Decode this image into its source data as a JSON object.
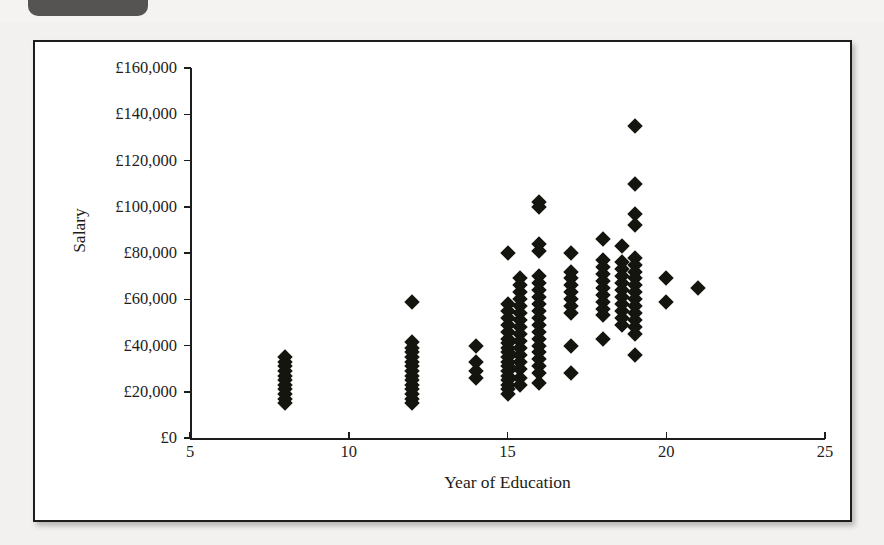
{
  "caption": {
    "badge_label": "",
    "text": ""
  },
  "chart_data": {
    "type": "scatter",
    "title": "",
    "xlabel": "Year of Education",
    "ylabel": "Salary",
    "xlim": [
      5,
      25
    ],
    "ylim": [
      0,
      160000
    ],
    "grid": false,
    "legend": null,
    "marker": "filled-diamond",
    "marker_color": "#15150f",
    "x_ticks": [
      5,
      10,
      15,
      20,
      25
    ],
    "x_tick_labels": [
      "5",
      "10",
      "15",
      "20",
      "25"
    ],
    "y_ticks": [
      0,
      20000,
      40000,
      60000,
      80000,
      100000,
      120000,
      140000,
      160000
    ],
    "y_tick_labels": [
      "£0",
      "£20,000",
      "£40,000",
      "£60,000",
      "£80,000",
      "£100,000",
      "£120,000",
      "£140,000",
      "£160,000"
    ],
    "points": [
      [
        8,
        15000
      ],
      [
        8,
        17000
      ],
      [
        8,
        19000
      ],
      [
        8,
        21000
      ],
      [
        8,
        23000
      ],
      [
        8,
        25000
      ],
      [
        8,
        27000
      ],
      [
        8,
        29000
      ],
      [
        8,
        31000
      ],
      [
        8,
        33000
      ],
      [
        8,
        35000
      ],
      [
        12,
        59000
      ],
      [
        12,
        15000
      ],
      [
        12,
        17000
      ],
      [
        12,
        19000
      ],
      [
        12,
        21000
      ],
      [
        12,
        23000
      ],
      [
        12,
        25000
      ],
      [
        12,
        27000
      ],
      [
        12,
        29000
      ],
      [
        12,
        31000
      ],
      [
        12,
        33000
      ],
      [
        12,
        35000
      ],
      [
        12,
        37000
      ],
      [
        12,
        39000
      ],
      [
        12,
        41500
      ],
      [
        14,
        26000
      ],
      [
        14,
        29000
      ],
      [
        14,
        33000
      ],
      [
        14,
        40000
      ],
      [
        15,
        80000
      ],
      [
        15,
        58000
      ],
      [
        15,
        55000
      ],
      [
        15,
        52000
      ],
      [
        15,
        49000
      ],
      [
        15,
        46000
      ],
      [
        15,
        43000
      ],
      [
        15,
        41000
      ],
      [
        15,
        39000
      ],
      [
        15,
        37000
      ],
      [
        15,
        35000
      ],
      [
        15,
        33000
      ],
      [
        15,
        31000
      ],
      [
        15,
        29000
      ],
      [
        15,
        27000
      ],
      [
        15,
        25000
      ],
      [
        15,
        23000
      ],
      [
        15,
        21000
      ],
      [
        15,
        19000
      ],
      [
        15.4,
        69000
      ],
      [
        15.4,
        66000
      ],
      [
        15.4,
        63000
      ],
      [
        15.4,
        60000
      ],
      [
        15.4,
        57000
      ],
      [
        15.4,
        54000
      ],
      [
        15.4,
        51000
      ],
      [
        15.4,
        48000
      ],
      [
        15.4,
        45000
      ],
      [
        15.4,
        42000
      ],
      [
        15.4,
        39000
      ],
      [
        15.4,
        36000
      ],
      [
        15.4,
        33000
      ],
      [
        15.4,
        30000
      ],
      [
        15.4,
        26000
      ],
      [
        15.4,
        23000
      ],
      [
        16,
        102000
      ],
      [
        16,
        100000
      ],
      [
        16,
        84000
      ],
      [
        16,
        81000
      ],
      [
        16,
        70000
      ],
      [
        16,
        67000
      ],
      [
        16,
        64000
      ],
      [
        16,
        61000
      ],
      [
        16,
        58000
      ],
      [
        16,
        55000
      ],
      [
        16,
        52000
      ],
      [
        16,
        49000
      ],
      [
        16,
        46000
      ],
      [
        16,
        43000
      ],
      [
        16,
        40000
      ],
      [
        16,
        37000
      ],
      [
        16,
        34000
      ],
      [
        16,
        31000
      ],
      [
        16,
        28000
      ],
      [
        16,
        24000
      ],
      [
        17,
        80000
      ],
      [
        17,
        72000
      ],
      [
        17,
        69000
      ],
      [
        17,
        66000
      ],
      [
        17,
        63000
      ],
      [
        17,
        60000
      ],
      [
        17,
        57000
      ],
      [
        17,
        54000
      ],
      [
        17,
        40000
      ],
      [
        17,
        28000
      ],
      [
        18,
        86000
      ],
      [
        18,
        77000
      ],
      [
        18,
        74000
      ],
      [
        18,
        71000
      ],
      [
        18,
        68000
      ],
      [
        18,
        65000
      ],
      [
        18,
        62000
      ],
      [
        18,
        59000
      ],
      [
        18,
        56000
      ],
      [
        18,
        53000
      ],
      [
        18,
        43000
      ],
      [
        18.6,
        83000
      ],
      [
        18.6,
        76000
      ],
      [
        18.6,
        73000
      ],
      [
        18.6,
        70000
      ],
      [
        18.6,
        67000
      ],
      [
        18.6,
        64000
      ],
      [
        18.6,
        61000
      ],
      [
        18.6,
        58000
      ],
      [
        18.6,
        55000
      ],
      [
        18.6,
        52000
      ],
      [
        18.6,
        49000
      ],
      [
        19,
        135000
      ],
      [
        19,
        110000
      ],
      [
        19,
        97000
      ],
      [
        19,
        92000
      ],
      [
        19,
        78000
      ],
      [
        19,
        75000
      ],
      [
        19,
        72000
      ],
      [
        19,
        69000
      ],
      [
        19,
        66000
      ],
      [
        19,
        63000
      ],
      [
        19,
        60000
      ],
      [
        19,
        57000
      ],
      [
        19,
        54000
      ],
      [
        19,
        51000
      ],
      [
        19,
        48000
      ],
      [
        19,
        45000
      ],
      [
        19,
        36000
      ],
      [
        20,
        69000
      ],
      [
        20,
        59000
      ],
      [
        21,
        65000
      ]
    ]
  }
}
